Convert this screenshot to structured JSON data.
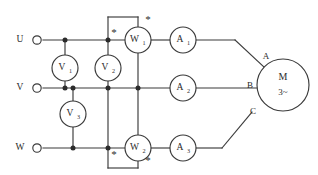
{
  "diagram": {
    "line_color": "#3a3a3a",
    "background": "#ffffff",
    "supply_terminals": [
      {
        "id": "U",
        "label": "U",
        "y": 40
      },
      {
        "id": "V",
        "label": "V",
        "y": 88
      },
      {
        "id": "W",
        "label": "W",
        "y": 148
      }
    ],
    "voltmeters": [
      {
        "id": "V1",
        "label": "V",
        "subscript": "1",
        "cx": 65,
        "cy": 68
      },
      {
        "id": "V2",
        "label": "V",
        "subscript": "2",
        "cx": 108,
        "cy": 68
      },
      {
        "id": "V3",
        "label": "V",
        "subscript": "3",
        "cx": 73,
        "cy": 114
      }
    ],
    "wattmeters": [
      {
        "id": "W1",
        "label": "W",
        "subscript": "1",
        "cx": 138,
        "cy": 40
      },
      {
        "id": "W2",
        "label": "W",
        "subscript": "2",
        "cx": 138,
        "cy": 148
      }
    ],
    "ammeters": [
      {
        "id": "A1",
        "label": "A",
        "subscript": "1",
        "cx": 183,
        "cy": 40
      },
      {
        "id": "A2",
        "label": "A",
        "subscript": "2",
        "cx": 183,
        "cy": 88
      },
      {
        "id": "A3",
        "label": "A",
        "subscript": "3",
        "cx": 183,
        "cy": 148
      }
    ],
    "polarity_marks": [
      {
        "id": "w1-current-star",
        "symbol": "*",
        "x": 114,
        "y": 34
      },
      {
        "id": "w1-voltage-star",
        "symbol": "*",
        "x": 147,
        "y": 20
      },
      {
        "id": "w2-current-star",
        "symbol": "*",
        "x": 114,
        "y": 154
      },
      {
        "id": "w2-voltage-star",
        "symbol": "*",
        "x": 147,
        "y": 161
      }
    ],
    "motor": {
      "label": "M",
      "sublabel": "3~",
      "cx": 283,
      "cy": 85,
      "r": 26,
      "terminals": [
        {
          "id": "A",
          "label": "A"
        },
        {
          "id": "B",
          "label": "B"
        },
        {
          "id": "C",
          "label": "C"
        }
      ]
    }
  }
}
